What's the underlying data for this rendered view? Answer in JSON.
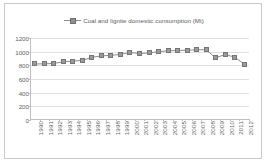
{
  "chart_data": {
    "type": "line",
    "title": "",
    "subtitle": "",
    "xlabel": "",
    "ylabel": "",
    "legend": {
      "position": "top-center",
      "entries": [
        "Coal and lignite domestic consumption (Mt)"
      ]
    },
    "series": [
      {
        "name": "Coal and lignite domestic consumption (Mt)",
        "marker": "square",
        "color": "#9a9a9a",
        "values": [
          820,
          822,
          828,
          852,
          862,
          872,
          918,
          938,
          946,
          960,
          988,
          972,
          982,
          1000,
          1012,
          1018,
          1020,
          1030,
          1026,
          910,
          958,
          920,
          818
        ]
      }
    ],
    "categories": [
      "1990",
      "1991",
      "1992",
      "1993",
      "1994",
      "1995",
      "1996",
      "1997",
      "1998",
      "1999",
      "2000",
      "2001",
      "2002",
      "2003",
      "2004",
      "2005",
      "2006",
      "2007",
      "2008",
      "2009",
      "2010",
      "2011",
      "2012"
    ],
    "ylim": [
      0,
      1200
    ],
    "yticks": [
      0,
      200,
      400,
      600,
      800,
      1000,
      1200
    ],
    "ytick_labels": [
      "0",
      "200",
      "400",
      "600",
      "800",
      "1000",
      "1200"
    ],
    "grid": true,
    "grid_axis": "y",
    "units": "Mt"
  },
  "style": {
    "series_color": "#9a9a9a",
    "line_color": "#8c8c8c",
    "grid_color": "#e0e0e0",
    "axis_color": "#bfbfbf",
    "text_color": "#5f5f5f",
    "frame_color": "#c9c9c9",
    "background": "#ffffff"
  }
}
